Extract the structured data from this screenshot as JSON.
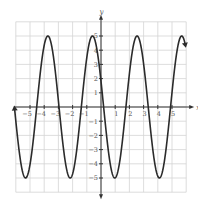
{
  "chart_data": {
    "type": "line",
    "title": "",
    "xlabel": "x",
    "ylabel": "y",
    "xlim": [
      -6,
      6
    ],
    "ylim": [
      -6,
      6
    ],
    "grid": true,
    "x_ticks": [
      "-5",
      "-4",
      "-3",
      "-2",
      "-1",
      "1",
      "2",
      "3",
      "4",
      "5"
    ],
    "y_ticks": [
      "5",
      "4",
      "3",
      "2",
      "1",
      "-1",
      "-2",
      "-3",
      "-4",
      "-5"
    ],
    "function": "y = 5 cos(2x + 1.2)",
    "amplitude": 5,
    "period": 3.14,
    "series": [
      {
        "name": "curve",
        "points": [
          [
            -6.1,
            0
          ],
          [
            -5.2,
            -5
          ],
          [
            -4.5,
            0
          ],
          [
            -3.6,
            5
          ],
          [
            -2.9,
            0
          ],
          [
            -2.1,
            -5
          ],
          [
            -1.4,
            0
          ],
          [
            -0.6,
            5
          ],
          [
            0.2,
            0
          ],
          [
            1.0,
            -5
          ],
          [
            1.8,
            0
          ],
          [
            2.5,
            5
          ],
          [
            3.3,
            0
          ],
          [
            4.1,
            -5
          ],
          [
            4.9,
            0
          ],
          [
            5.7,
            5
          ],
          [
            5.9,
            4.3
          ]
        ],
        "arrows": [
          "left",
          "right"
        ]
      }
    ]
  },
  "colors": {
    "curve": "#2b2b2b",
    "grid": "#d4d4d4",
    "axis": "#333333"
  }
}
